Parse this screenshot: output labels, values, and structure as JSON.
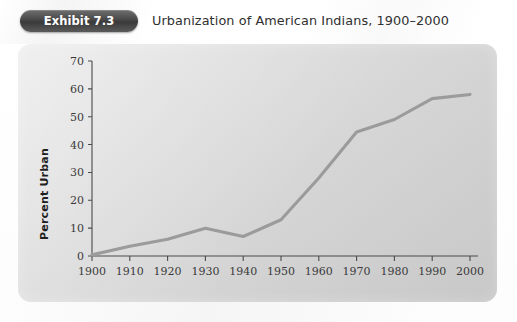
{
  "header": {
    "badge_label": "Exhibit 7.3",
    "title": "Urbanization of American Indians, 1900–2000"
  },
  "colors": {
    "badge_bg": "#4a4a4a",
    "badge_text": "#ffffff",
    "panel_bg": "#dcdcdc",
    "line": "#9b9b9b",
    "axis": "#4a4a4a",
    "tick_text": "#3b3b3b",
    "page_bg": "#ffffff"
  },
  "chart_data": {
    "type": "line",
    "title": "Urbanization of American Indians, 1900–2000",
    "xlabel": "",
    "ylabel": "Percent Urban",
    "x": [
      1900,
      1910,
      1920,
      1930,
      1940,
      1950,
      1960,
      1970,
      1980,
      1990,
      2000
    ],
    "values": [
      0.4,
      3.5,
      6.0,
      10.0,
      7.0,
      13.0,
      28.0,
      44.5,
      49.0,
      56.5,
      58.0
    ],
    "series": [
      {
        "name": "Percent Urban",
        "values": [
          0.4,
          3.5,
          6.0,
          10.0,
          7.0,
          13.0,
          28.0,
          44.5,
          49.0,
          56.5,
          58.0
        ]
      }
    ],
    "xlim": [
      1900,
      2000
    ],
    "ylim": [
      0,
      70
    ],
    "x_tick_labels": [
      "1900",
      "1910",
      "1920",
      "1930",
      "1940",
      "1950",
      "1960",
      "1970",
      "1980",
      "1990",
      "2000"
    ],
    "y_tick_labels": [
      "0",
      "10",
      "20",
      "30",
      "40",
      "50",
      "60",
      "70"
    ],
    "y_ticks": [
      0,
      10,
      20,
      30,
      40,
      50,
      60,
      70
    ],
    "grid": false,
    "legend": false,
    "legend_position": "none"
  }
}
